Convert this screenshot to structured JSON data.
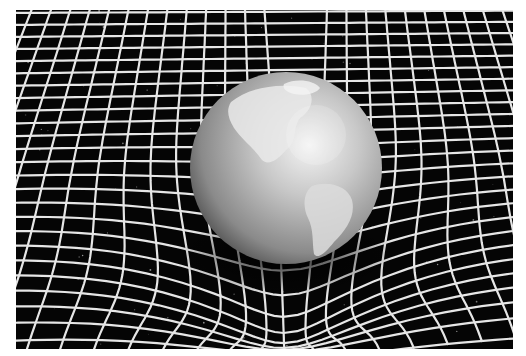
{
  "image": {
    "subject": "Earth sphere resting in a warped spacetime grid",
    "alt": "Grayscale illustration of planet Earth sitting in a curved white grid representing gravitational warping of spacetime against a black starry background",
    "palette": {
      "background": "#ffffff",
      "space": "#050505",
      "grid": "#e6e6e6",
      "sphere_light": "#f2f2f2",
      "sphere_mid": "#9a9a9a",
      "sphere_dark": "#3a3a3a"
    },
    "elements": [
      "spacetime-grid",
      "earth-sphere",
      "stars"
    ]
  }
}
